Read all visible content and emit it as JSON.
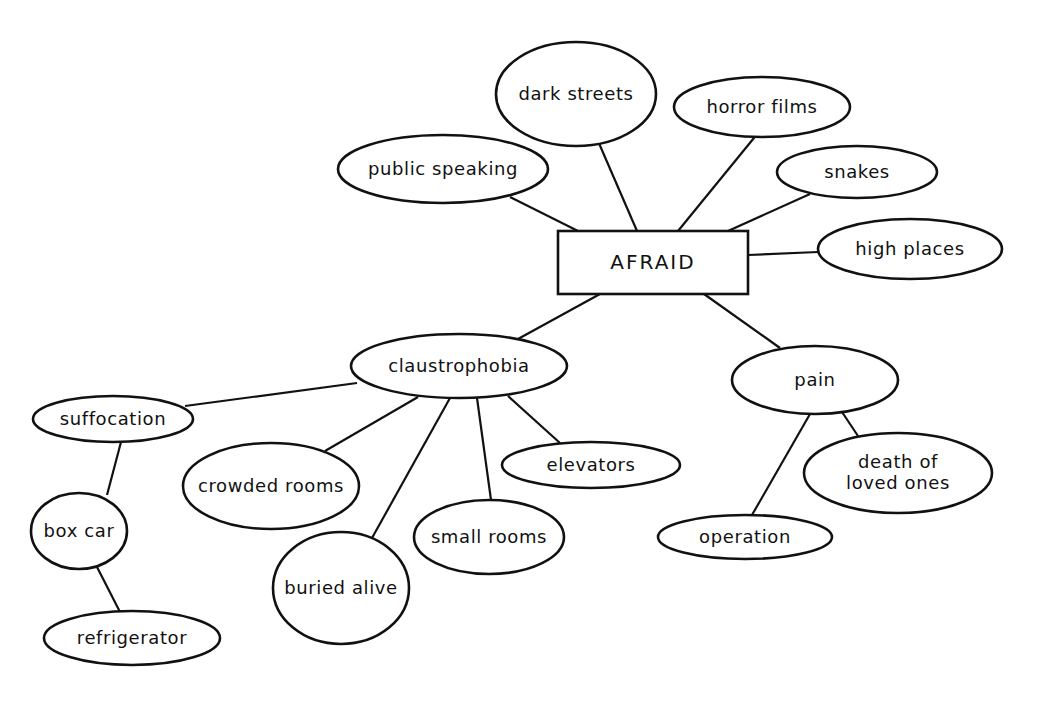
{
  "diagram": {
    "type": "concept-map",
    "root": {
      "id": "afraid",
      "label": "AFRAID",
      "shape": "rect",
      "x": 558,
      "y": 231,
      "w": 190,
      "h": 63
    },
    "nodes": [
      {
        "id": "dark-streets",
        "label": "dark streets",
        "cx": 576,
        "cy": 94,
        "rx": 80,
        "ry": 52
      },
      {
        "id": "horror-films",
        "label": "horror films",
        "cx": 762,
        "cy": 107,
        "rx": 88,
        "ry": 30
      },
      {
        "id": "public-speaking",
        "label": "public speaking",
        "cx": 443,
        "cy": 169,
        "rx": 105,
        "ry": 34
      },
      {
        "id": "snakes",
        "label": "snakes",
        "cx": 857,
        "cy": 172,
        "rx": 80,
        "ry": 26
      },
      {
        "id": "high-places",
        "label": "high places",
        "cx": 910,
        "cy": 249,
        "rx": 92,
        "ry": 30
      },
      {
        "id": "claustrophobia",
        "label": "claustrophobia",
        "cx": 459,
        "cy": 366,
        "rx": 108,
        "ry": 32
      },
      {
        "id": "pain",
        "label": "pain",
        "cx": 815,
        "cy": 380,
        "rx": 83,
        "ry": 34
      },
      {
        "id": "suffocation",
        "label": "suffocation",
        "cx": 113,
        "cy": 419,
        "rx": 80,
        "ry": 23
      },
      {
        "id": "crowded-rooms",
        "label": "crowded rooms",
        "cx": 271,
        "cy": 486,
        "rx": 88,
        "ry": 43
      },
      {
        "id": "elevators",
        "label": "elevators",
        "cx": 591,
        "cy": 465,
        "rx": 89,
        "ry": 23
      },
      {
        "id": "death-of-loved-ones",
        "label": "death of",
        "label2": "loved ones",
        "cx": 898,
        "cy": 473,
        "rx": 94,
        "ry": 40
      },
      {
        "id": "box-car",
        "label": "box car",
        "cx": 79,
        "cy": 531,
        "rx": 48,
        "ry": 38
      },
      {
        "id": "small-rooms",
        "label": "small rooms",
        "cx": 489,
        "cy": 537,
        "rx": 75,
        "ry": 37
      },
      {
        "id": "operation",
        "label": "operation",
        "cx": 745,
        "cy": 537,
        "rx": 87,
        "ry": 22
      },
      {
        "id": "buried-alive",
        "label": "buried alive",
        "cx": 341,
        "cy": 588,
        "rx": 68,
        "ry": 56
      },
      {
        "id": "refrigerator",
        "label": "refrigerator",
        "cx": 132,
        "cy": 638,
        "rx": 88,
        "ry": 27
      }
    ],
    "edges": [
      {
        "from": "afraid",
        "to": "public-speaking",
        "x1": 578,
        "y1": 231,
        "x2": 510,
        "y2": 197
      },
      {
        "from": "afraid",
        "to": "dark-streets",
        "x1": 637,
        "y1": 231,
        "x2": 598,
        "y2": 141
      },
      {
        "from": "afraid",
        "to": "horror-films",
        "x1": 678,
        "y1": 231,
        "x2": 758,
        "y2": 133
      },
      {
        "from": "afraid",
        "to": "snakes",
        "x1": 728,
        "y1": 231,
        "x2": 810,
        "y2": 194
      },
      {
        "from": "afraid",
        "to": "high-places",
        "x1": 748,
        "y1": 255,
        "x2": 818,
        "y2": 252
      },
      {
        "from": "afraid",
        "to": "claustrophobia",
        "x1": 600,
        "y1": 294,
        "x2": 518,
        "y2": 339
      },
      {
        "from": "afraid",
        "to": "pain",
        "x1": 704,
        "y1": 294,
        "x2": 780,
        "y2": 348
      },
      {
        "from": "claustrophobia",
        "to": "suffocation",
        "x1": 357,
        "y1": 383,
        "x2": 185,
        "y2": 406
      },
      {
        "from": "claustrophobia",
        "to": "crowded-rooms",
        "x1": 418,
        "y1": 397,
        "x2": 325,
        "y2": 451
      },
      {
        "from": "claustrophobia",
        "to": "buried-alive",
        "x1": 450,
        "y1": 398,
        "x2": 372,
        "y2": 538
      },
      {
        "from": "claustrophobia",
        "to": "small-rooms",
        "x1": 477,
        "y1": 398,
        "x2": 491,
        "y2": 500
      },
      {
        "from": "claustrophobia",
        "to": "elevators",
        "x1": 508,
        "y1": 396,
        "x2": 560,
        "y2": 443
      },
      {
        "from": "suffocation",
        "to": "box-car",
        "x1": 121,
        "y1": 442,
        "x2": 107,
        "y2": 495
      },
      {
        "from": "box-car",
        "to": "refrigerator",
        "x1": 97,
        "y1": 567,
        "x2": 120,
        "y2": 612
      },
      {
        "from": "pain",
        "to": "operation",
        "x1": 810,
        "y1": 414,
        "x2": 752,
        "y2": 515
      },
      {
        "from": "pain",
        "to": "death-of-loved-ones",
        "x1": 842,
        "y1": 412,
        "x2": 858,
        "y2": 436
      }
    ]
  }
}
